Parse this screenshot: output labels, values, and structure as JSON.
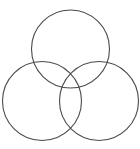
{
  "figure": {
    "canvas": {
      "width": 140,
      "height": 149,
      "background_color": "#ffffff"
    },
    "style": {
      "stroke_color": "#4a4a4a",
      "stroke_width": 1.1,
      "fill": "none"
    },
    "shapes": [
      {
        "name": "top-circle",
        "label": "Top circle",
        "cx": 70.5,
        "cy": 49,
        "r": 39
      },
      {
        "name": "bottom-left-circle",
        "label": "Bottom left circle",
        "cx": 42,
        "cy": 101,
        "r": 39.5
      },
      {
        "name": "bottom-right-circle",
        "label": "Bottom right circle",
        "cx": 99,
        "cy": 101,
        "r": 39.5
      }
    ]
  },
  "chart_data": {
    "type": "diagram",
    "subtitle": "",
    "xlabel": "",
    "ylabel": "",
    "legend": [],
    "annotations": [],
    "grid": false,
    "shape_count": 3,
    "shape_kind": "circle",
    "arrangement": "triangular trefoil / three-set Venn",
    "circles": [
      {
        "id": "top",
        "cx": 70.5,
        "cy": 49,
        "r": 39
      },
      {
        "id": "bottom-left",
        "cx": 42,
        "cy": 101,
        "r": 39.5
      },
      {
        "id": "bottom-right",
        "cx": 99,
        "cy": 101,
        "r": 39.5
      }
    ],
    "xlim": [
      0,
      140
    ],
    "ylim": [
      0,
      149
    ]
  }
}
